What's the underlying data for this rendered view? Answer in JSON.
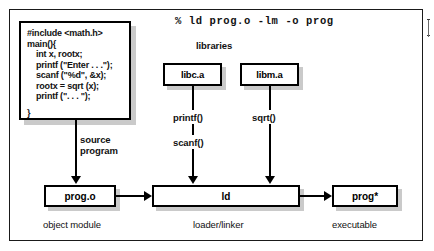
{
  "diagram": {
    "command": "% ld prog.o -lm -o prog",
    "libraries_heading": "libraries",
    "source_code": {
      "lines": [
        {
          "text": "#include <math.h>",
          "indent": false
        },
        {
          "text": "main(){",
          "indent": false
        },
        {
          "text": "int x, rootx;",
          "indent": true
        },
        {
          "text": "printf (\"Enter . . .\");",
          "indent": true
        },
        {
          "text": "scanf (\"%d\", &x);",
          "indent": true
        },
        {
          "text": "rootx = sqrt (x);",
          "indent": true
        },
        {
          "text": "printf (\". . . \");",
          "indent": true
        },
        {
          "text": "}",
          "indent": false
        }
      ]
    },
    "boxes": {
      "libc": "libc.a",
      "libm": "libm.a",
      "object": "prog.o",
      "linker": "ld",
      "executable": "prog*"
    },
    "edge_labels": {
      "source_line1": "source",
      "source_line2": "program",
      "printf": "printf()",
      "scanf": "scanf()",
      "sqrt": "sqrt()"
    },
    "captions": {
      "object_module": "object module",
      "loader_linker": "loader/linker",
      "executable": "executable"
    },
    "colors": {
      "stroke": "#000000",
      "background": "#ffffff",
      "shadow": "#9a9a9a"
    }
  }
}
